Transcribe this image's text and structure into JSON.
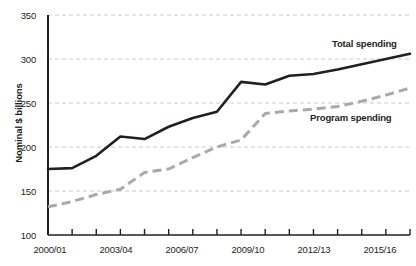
{
  "chart_data": {
    "type": "line",
    "title": "",
    "xlabel": "",
    "ylabel": "Nominal $ billions",
    "ylim": [
      100,
      350
    ],
    "yticks": [
      100,
      150,
      200,
      250,
      300,
      350
    ],
    "grid": true,
    "legend_position": "inline-annotation",
    "x": [
      "2000/01",
      "2001/02",
      "2002/03",
      "2003/04",
      "2004/05",
      "2005/06",
      "2006/07",
      "2007/08",
      "2008/09",
      "2009/10",
      "2010/11",
      "2011/12",
      "2012/13",
      "2013/14",
      "2014/15",
      "2015/16"
    ],
    "xtick_labels": [
      "2000/01",
      "2003/04",
      "2006/07",
      "2009/10",
      "2012/13",
      "2015/16"
    ],
    "xtick_label_indices": [
      0,
      3,
      6,
      9,
      12,
      15
    ],
    "series": [
      {
        "name": "Total spending",
        "style": "solid",
        "color": "#231f20",
        "values": [
          175,
          176,
          190,
          212,
          209,
          223,
          233,
          240,
          274,
          271,
          281,
          283,
          288,
          294,
          300,
          306
        ]
      },
      {
        "name": "Program spending",
        "style": "dashed",
        "color": "#a7a9ac",
        "values": [
          132,
          138,
          146,
          152,
          171,
          175,
          188,
          200,
          208,
          238,
          241,
          243,
          246,
          252,
          259,
          267
        ]
      }
    ],
    "annotations": [
      {
        "text": "Total spending",
        "series": "Total spending"
      },
      {
        "text": "Program spending",
        "series": "Program spending"
      }
    ]
  },
  "axis": {
    "y_title": "Nominal $ billions",
    "y_ticks": [
      "350",
      "300",
      "250",
      "200",
      "150",
      "100"
    ],
    "x_ticks": [
      "2000/01",
      "2003/04",
      "2006/07",
      "2009/10",
      "2012/13",
      "2015/16"
    ]
  },
  "labels": {
    "total_spending": "Total spending",
    "program_spending": "Program spending"
  },
  "colors": {
    "total_line": "#231f20",
    "program_line": "#a7a9ac",
    "grid": "#c9cbcd",
    "axis": "#231f20",
    "text": "#231f20",
    "background": "#ffffff"
  }
}
